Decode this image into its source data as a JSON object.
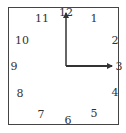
{
  "clock": {
    "shape": "square",
    "time_shown": "3:00",
    "numerals": [
      {
        "label": "12",
        "x": 66,
        "y": 12
      },
      {
        "label": "1",
        "x": 94,
        "y": 18
      },
      {
        "label": "2",
        "x": 115,
        "y": 40
      },
      {
        "label": "3",
        "x": 119,
        "y": 66
      },
      {
        "label": "4",
        "x": 115,
        "y": 92
      },
      {
        "label": "5",
        "x": 94,
        "y": 113
      },
      {
        "label": "6",
        "x": 68,
        "y": 120
      },
      {
        "label": "7",
        "x": 41,
        "y": 114
      },
      {
        "label": "8",
        "x": 20,
        "y": 93
      },
      {
        "label": "9",
        "x": 14,
        "y": 66
      },
      {
        "label": "10",
        "x": 22,
        "y": 40
      },
      {
        "label": "11",
        "x": 42,
        "y": 18
      }
    ],
    "center": {
      "x": 66,
      "y": 66
    },
    "minute_hand": {
      "points_to": "12",
      "end": {
        "x": 66,
        "y": 13
      }
    },
    "hour_hand": {
      "points_to": "3",
      "end": {
        "x": 112,
        "y": 66
      }
    },
    "colors": {
      "border": "#444444",
      "hands": "#333333",
      "numerals": "#333333"
    }
  }
}
